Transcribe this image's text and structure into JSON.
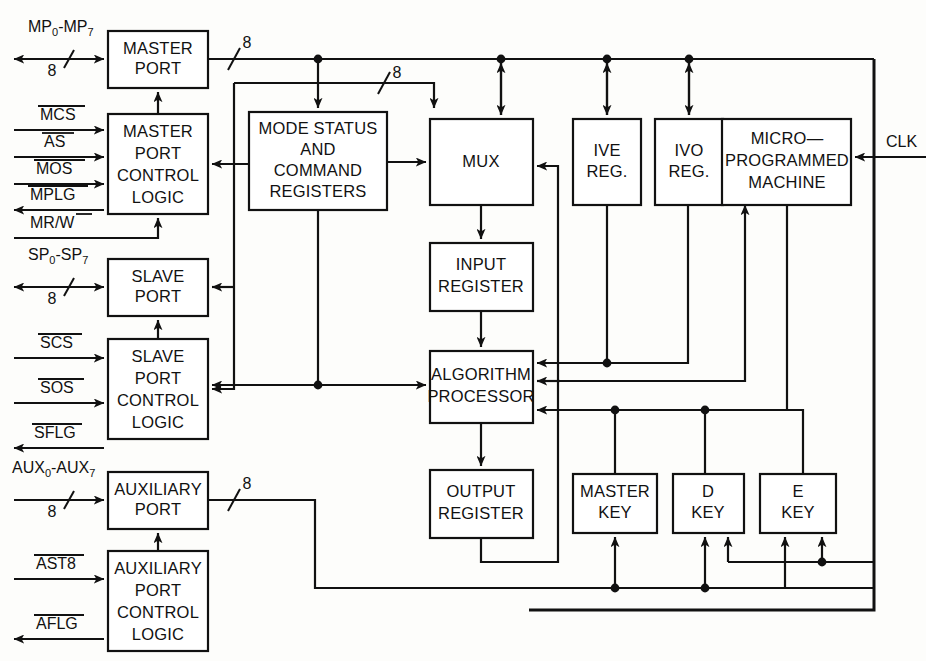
{
  "diagram": {
    "blocks": [
      {
        "id": "master_port",
        "label_lines": [
          "MASTER",
          "PORT"
        ],
        "x": 108,
        "y": 31,
        "w": 100,
        "h": 57
      },
      {
        "id": "master_port_control_logic",
        "label_lines": [
          "MASTER",
          "PORT",
          "CONTROL",
          "LOGIC"
        ],
        "x": 108,
        "y": 114,
        "w": 100,
        "h": 100
      },
      {
        "id": "mode_status_command_registers",
        "label_lines": [
          "MODE STATUS",
          "AND",
          "COMMAND",
          "REGISTERS"
        ],
        "x": 249,
        "y": 112,
        "w": 138,
        "h": 98
      },
      {
        "id": "mux",
        "label_lines": [
          "MUX"
        ],
        "x": 430,
        "y": 119,
        "w": 103,
        "h": 86
      },
      {
        "id": "ive_reg",
        "label_lines": [
          "IVE",
          "REG."
        ],
        "x": 573,
        "y": 119,
        "w": 68,
        "h": 86
      },
      {
        "id": "ivo_reg",
        "label_lines": [
          "IVO",
          "REG."
        ],
        "x": 655,
        "y": 119,
        "w": 68,
        "h": 86
      },
      {
        "id": "micro_programmed_machine",
        "label_lines": [
          "MICRO—",
          "PROGRAMMED",
          "MACHINE"
        ],
        "x": 722,
        "y": 119,
        "w": 129,
        "h": 86
      },
      {
        "id": "slave_port",
        "label_lines": [
          "SLAVE",
          "PORT"
        ],
        "x": 108,
        "y": 259,
        "w": 100,
        "h": 57
      },
      {
        "id": "input_register",
        "label_lines": [
          "INPUT",
          "REGISTER"
        ],
        "x": 430,
        "y": 243,
        "w": 103,
        "h": 68
      },
      {
        "id": "slave_port_control_logic",
        "label_lines": [
          "SLAVE",
          "PORT",
          "CONTROL",
          "LOGIC"
        ],
        "x": 108,
        "y": 339,
        "w": 100,
        "h": 100
      },
      {
        "id": "algorithm_processor",
        "label_lines": [
          "ALGORITHM",
          "PROCESSOR"
        ],
        "x": 430,
        "y": 351,
        "w": 103,
        "h": 72
      },
      {
        "id": "auxiliary_port",
        "label_lines": [
          "AUXILIARY",
          "PORT"
        ],
        "x": 108,
        "y": 472,
        "w": 100,
        "h": 57
      },
      {
        "id": "output_register",
        "label_lines": [
          "OUTPUT",
          "REGISTER"
        ],
        "x": 430,
        "y": 470,
        "w": 103,
        "h": 68
      },
      {
        "id": "master_key",
        "label_lines": [
          "MASTER",
          "KEY"
        ],
        "x": 573,
        "y": 474,
        "w": 84,
        "h": 59
      },
      {
        "id": "d_key",
        "label_lines": [
          "D",
          "KEY"
        ],
        "x": 673,
        "y": 474,
        "w": 71,
        "h": 59
      },
      {
        "id": "e_key",
        "label_lines": [
          "E",
          "KEY"
        ],
        "x": 760,
        "y": 474,
        "w": 76,
        "h": 59
      },
      {
        "id": "auxiliary_port_control_logic",
        "label_lines": [
          "AUXILIARY",
          "PORT",
          "CONTROL",
          "LOGIC"
        ],
        "x": 108,
        "y": 551,
        "w": 100,
        "h": 100
      }
    ],
    "signals": [
      {
        "id": "mp_bus",
        "text": "MP",
        "sub": "0",
        "text2": "-MP",
        "sub2": "7",
        "x": 28,
        "y": 28
      },
      {
        "id": "mcs",
        "text": "MCS",
        "overline": true,
        "x": 40,
        "y": 116
      },
      {
        "id": "as",
        "text": "AS",
        "overline": true,
        "x": 44,
        "y": 143
      },
      {
        "id": "mos",
        "text": "MOS",
        "overline": true,
        "x": 36,
        "y": 170
      },
      {
        "id": "mplg",
        "text": "MPLG",
        "overline": true,
        "x": 30,
        "y": 196
      },
      {
        "id": "mrw",
        "text": "MR/W",
        "overline_partial": true,
        "x": 30,
        "y": 224
      },
      {
        "id": "sp_bus",
        "text": "SP",
        "sub": "0",
        "text2": "-SP",
        "sub2": "7",
        "x": 28,
        "y": 256
      },
      {
        "id": "scs",
        "text": "SCS",
        "overline": true,
        "x": 40,
        "y": 344
      },
      {
        "id": "sos",
        "text": "SOS",
        "overline": true,
        "x": 40,
        "y": 389
      },
      {
        "id": "sflg",
        "text": "SFLG",
        "overline": true,
        "x": 34,
        "y": 434
      },
      {
        "id": "aux_bus",
        "text": "AUX",
        "sub": "0",
        "text2": "-AUX",
        "sub2": "7",
        "x": 12,
        "y": 469
      },
      {
        "id": "ast8",
        "text": "AST8",
        "overline": true,
        "x": 36,
        "y": 565
      },
      {
        "id": "aflg",
        "text": "AFLG",
        "overline": true,
        "x": 36,
        "y": 625
      },
      {
        "id": "clk",
        "text": "CLK",
        "overline": false,
        "x": 886,
        "y": 143
      }
    ],
    "bus_width_labels": [
      {
        "id": "mp_width",
        "value": "8",
        "x": 52,
        "y": 72
      },
      {
        "id": "mp_out_width",
        "value": "8",
        "x": 247,
        "y": 44
      },
      {
        "id": "ms_in_width",
        "value": "8",
        "x": 397,
        "y": 74
      },
      {
        "id": "sp_width",
        "value": "8",
        "x": 52,
        "y": 300
      },
      {
        "id": "aux_in_width",
        "value": "8",
        "x": 52,
        "y": 513
      },
      {
        "id": "aux_out_width",
        "value": "8",
        "x": 247,
        "y": 485
      }
    ]
  }
}
